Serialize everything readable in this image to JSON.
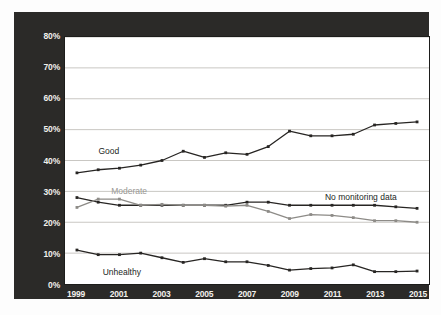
{
  "chart_data": {
    "type": "line",
    "title": "",
    "subtitle": "",
    "xlabel": "",
    "ylabel": "",
    "xlim": [
      1999,
      2015
    ],
    "ylim": [
      0,
      80
    ],
    "grid": true,
    "grid_axis": "y",
    "legend_position": "inline-annotations",
    "x": [
      1999,
      2000,
      2001,
      2002,
      2003,
      2004,
      2005,
      2006,
      2007,
      2008,
      2009,
      2010,
      2011,
      2012,
      2013,
      2014,
      2015
    ],
    "x_tick_labels": [
      "1999",
      "2001",
      "2003",
      "2005",
      "2007",
      "2009",
      "2011",
      "2013",
      "2015"
    ],
    "x_tick_values": [
      1999,
      2001,
      2003,
      2005,
      2007,
      2009,
      2011,
      2013,
      2015
    ],
    "y_tick_labels": [
      "0%",
      "10%",
      "20%",
      "30%",
      "40%",
      "50%",
      "60%",
      "70%",
      "80%"
    ],
    "y_tick_values": [
      0,
      10,
      20,
      30,
      40,
      50,
      60,
      70,
      80
    ],
    "series": [
      {
        "name": "Good",
        "color": "#272523",
        "label_class": "dark",
        "values": [
          36,
          37,
          37.5,
          38.5,
          40,
          43,
          41,
          42.5,
          42,
          44.5,
          49.5,
          48,
          48,
          48.5,
          51.5,
          52,
          52.5
        ]
      },
      {
        "name": "No monitoring data",
        "color": "#272523",
        "label_class": "dark",
        "values": [
          28,
          26.5,
          25.5,
          25.5,
          25.5,
          25.5,
          25.5,
          25.5,
          26.5,
          26.5,
          25.5,
          25.5,
          25.5,
          25.5,
          25.5,
          25,
          24.5
        ]
      },
      {
        "name": "Moderate",
        "color": "#8d8b87",
        "label_class": "grey",
        "values": [
          24.8,
          27.5,
          27.5,
          25.5,
          25.8,
          25.5,
          25.5,
          25.2,
          25.5,
          23.5,
          21.2,
          22.5,
          22.2,
          21.5,
          20.5,
          20.5,
          20
        ]
      },
      {
        "name": "Unhealthy",
        "color": "#272523",
        "label_class": "dark",
        "values": [
          11,
          9.5,
          9.5,
          10,
          8.5,
          7,
          8.2,
          7.2,
          7.2,
          6,
          4.5,
          5,
          5.2,
          6.2,
          4,
          4,
          4.2
        ]
      }
    ],
    "annotations": [
      {
        "text": "Good",
        "x": 2000,
        "y": 43.5,
        "style": "dark"
      },
      {
        "text": "Moderate",
        "x": 2000.6,
        "y": 30.5,
        "style": "grey"
      },
      {
        "text": "No monitoring data",
        "x": 2010.6,
        "y": 28.5,
        "style": "dark"
      },
      {
        "text": "Unhealthy",
        "x": 2000.2,
        "y": 4.6,
        "style": "dark"
      }
    ],
    "colors": {
      "panel_background": "#2b2a28",
      "plot_background": "#ffffff",
      "gridline": "#c9c7c3",
      "axis_text": "#f2f0ec",
      "series_dark": "#272523",
      "series_grey": "#8d8b87"
    }
  }
}
